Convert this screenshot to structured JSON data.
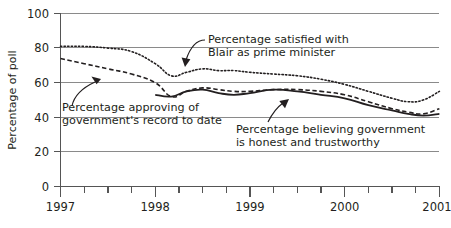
{
  "chart_data": {
    "type": "line",
    "title": "",
    "subtitle": "",
    "xlabel": "",
    "ylabel": "Percentage of poll",
    "xlim": [
      1997.0,
      2001.0
    ],
    "ylim": [
      0,
      100
    ],
    "yticks": [
      0,
      20,
      40,
      60,
      80,
      100
    ],
    "ytick_labels": [
      "0",
      "20",
      "40",
      "60",
      "80",
      "100"
    ],
    "xticks": [
      1997,
      1998,
      1999,
      2000,
      2001
    ],
    "xtick_labels": [
      "1997",
      "1998",
      "1999",
      "2000",
      "2001"
    ],
    "x_minor_tick_interval": 0.25,
    "grid": "horizontal",
    "legend": "none (annotated labels with leader arrows)",
    "series": [
      {
        "name": "Percentage satisfied with Blair as prime minister",
        "style": "dotted",
        "color": "#231f20",
        "x": [
          1997.0,
          1997.25,
          1997.5,
          1997.75,
          1998.0,
          1998.17,
          1998.33,
          1998.5,
          1998.67,
          1998.83,
          1999.0,
          1999.25,
          1999.5,
          1999.75,
          2000.0,
          2000.25,
          2000.5,
          2000.67,
          2000.83,
          2001.0
        ],
        "values": [
          81,
          81,
          80,
          78,
          71,
          64,
          66,
          68,
          67,
          67,
          66,
          65,
          64,
          62,
          59,
          55,
          51,
          49,
          50,
          55
        ]
      },
      {
        "name": "Percentage approving of government's record to date",
        "style": "dashed",
        "color": "#231f20",
        "x": [
          1997.0,
          1997.25,
          1997.5,
          1997.75,
          1998.0,
          1998.17,
          1998.33,
          1998.5,
          1998.67,
          1998.83,
          1999.0,
          1999.25,
          1999.5,
          1999.75,
          2000.0,
          2000.25,
          2000.5,
          2000.67,
          2000.83,
          2001.0
        ],
        "values": [
          74,
          71,
          68,
          65,
          60,
          52,
          55,
          57,
          56,
          55,
          55,
          56,
          56,
          55,
          53,
          49,
          45,
          43,
          42,
          45
        ]
      },
      {
        "name": "Percentage believing government is honest and trustworthy",
        "style": "solid",
        "color": "#231f20",
        "x": [
          1998.0,
          1998.17,
          1998.33,
          1998.5,
          1998.67,
          1998.83,
          1999.0,
          1999.25,
          1999.5,
          1999.75,
          2000.0,
          2000.25,
          2000.5,
          2000.67,
          2000.83,
          2001.0
        ],
        "values": [
          53,
          52,
          55,
          56,
          54,
          53,
          54,
          56,
          55,
          53,
          51,
          47,
          44,
          42,
          41,
          42
        ]
      }
    ],
    "annotations": [
      {
        "id": "blair",
        "lines": [
          "Percentage satisfied with",
          "Blair as prime minister"
        ],
        "points_to_series": "Percentage satisfied with Blair as prime minister"
      },
      {
        "id": "approval",
        "lines": [
          "Percentage approving of",
          "government's record to date"
        ],
        "points_to_series": "Percentage approving of government's record to date"
      },
      {
        "id": "honesty",
        "lines": [
          "Percentage believing government",
          "is honest and trustworthy"
        ],
        "points_to_series": "Percentage believing government is honest and trustworthy"
      }
    ]
  },
  "axes": {
    "y_axis_label": "Percentage of poll",
    "y_tick_0": "0",
    "y_tick_20": "20",
    "y_tick_40": "40",
    "y_tick_60": "60",
    "y_tick_80": "80",
    "y_tick_100": "100",
    "x_tick_1997": "1997",
    "x_tick_1998": "1998",
    "x_tick_1999": "1999",
    "x_tick_2000": "2000",
    "x_tick_2001": "2001"
  },
  "annotations": {
    "blair_line1": "Percentage satisfied with",
    "blair_line2": "Blair as prime minister",
    "approval_line1": "Percentage approving of",
    "approval_line2": "government's record to date",
    "honesty_line1": "Percentage believing government",
    "honesty_line2": "is honest and trustworthy"
  },
  "colors": {
    "ink": "#231f20",
    "grid": "#8a8a8a",
    "background": "#ffffff"
  }
}
